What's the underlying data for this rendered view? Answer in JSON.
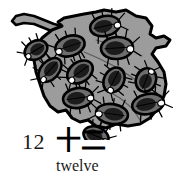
{
  "card": {
    "type": "counting-flashcard",
    "numeral": "12",
    "hanzi": "十二",
    "word": "twelve",
    "count": 12
  },
  "illustration": {
    "name": "leaf-with-insects",
    "description": "A gray leaf with a stem at the upper left, covered with twelve dark oval insects",
    "colors": {
      "leaf_fill": "#9c9c9c",
      "leaf_outline": "#000000",
      "leaf_vein": "#5a5a5a",
      "insect_body": "#6d6d6d",
      "insect_outline": "#000000",
      "insect_center": "#1c1c1c",
      "insect_highlight": "#ffffff",
      "background": "#ffffff"
    },
    "leaf": {
      "name": "leaf-shape",
      "path": "M 96 12 L 104 10 L 116 12 L 126 10 L 136 16 L 146 18 L 152 26 L 150 34 L 156 38 L 164 36 L 170 40 L 166 46 L 156 48 L 152 54 L 158 62 L 164 72 L 166 84 L 164 96 L 158 108 L 150 118 L 140 124 L 128 126 L 116 124 L 106 128 L 96 126 L 88 120 L 80 122 L 72 118 L 66 110 L 58 112 L 50 106 L 44 96 L 40 84 L 36 72 L 34 60 L 36 48 L 42 38 L 52 30 L 62 26 L 58 22 L 64 18 L 74 16 L 84 14 Z"
    },
    "stem": {
      "name": "leaf-stem",
      "path": "M 62 26 L 54 24 L 44 20 L 34 16 L 24 14 L 16 16 L 12 21 L 16 25 L 24 23 L 34 24 L 44 28 L 54 32 L 60 34 Z"
    },
    "veins": [
      {
        "name": "vein-upper",
        "path": "M 96 40 L 110 44 L 126 48 L 142 56"
      },
      {
        "name": "vein-mid",
        "path": "M 84 52 L 98 58 L 114 66 L 130 76 L 144 86"
      },
      {
        "name": "vein-lower",
        "path": "M 106 90 L 120 98 L 132 108 L 140 120"
      }
    ],
    "insects": [
      {
        "name": "insect-1",
        "cx": 105,
        "cy": 26,
        "rx": 15,
        "ry": 10,
        "rot": -12,
        "hx": 17,
        "hy": -1
      },
      {
        "name": "insect-2",
        "cx": 70,
        "cy": 46,
        "rx": 15,
        "ry": 10,
        "rot": -18,
        "hx": -16,
        "hy": 4
      },
      {
        "name": "insect-3",
        "cx": 117,
        "cy": 48,
        "rx": 16,
        "ry": 11,
        "rot": -4,
        "hx": 17,
        "hy": 3
      },
      {
        "name": "insect-4",
        "cx": 36,
        "cy": 50,
        "rx": 12,
        "ry": 9,
        "rot": -30,
        "hx": -11,
        "hy": 7
      },
      {
        "name": "insect-5",
        "cx": 50,
        "cy": 70,
        "rx": 14,
        "ry": 9,
        "rot": -48,
        "hx": -5,
        "hy": 11
      },
      {
        "name": "insect-6",
        "cx": 80,
        "cy": 72,
        "rx": 14,
        "ry": 10,
        "rot": -36,
        "hx": -9,
        "hy": 9
      },
      {
        "name": "insect-7",
        "cx": 114,
        "cy": 80,
        "rx": 13,
        "ry": 10,
        "rot": -62,
        "hx": -2,
        "hy": 13
      },
      {
        "name": "insect-8",
        "cx": 146,
        "cy": 80,
        "rx": 12,
        "ry": 10,
        "rot": -68,
        "hx": 2,
        "hy": 13
      },
      {
        "name": "insect-9",
        "cx": 78,
        "cy": 98,
        "rx": 15,
        "ry": 10,
        "rot": -8,
        "hx": 16,
        "hy": 4
      },
      {
        "name": "insect-10",
        "cx": 148,
        "cy": 104,
        "rx": 16,
        "ry": 10,
        "rot": -12,
        "hx": 17,
        "hy": 1
      },
      {
        "name": "insect-11",
        "cx": 112,
        "cy": 114,
        "rx": 16,
        "ry": 10,
        "rot": 8,
        "hx": -17,
        "hy": 1
      },
      {
        "name": "insect-12",
        "cx": 96,
        "cy": 136,
        "rx": 13,
        "ry": 9,
        "rot": 22,
        "hx": 13,
        "hy": 6
      }
    ]
  }
}
